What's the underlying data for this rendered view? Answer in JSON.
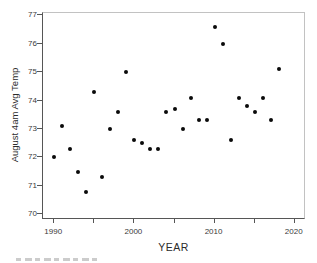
{
  "figure": {
    "xlabel": "YEAR",
    "ylabel": "August 4am Avg Temp",
    "colors": {
      "marker": "#0a0a0a",
      "axis_dark": "#565656",
      "axis_light": "#c2c2c2",
      "tick_text": "#3a3a3a",
      "title_text": "#2b2b2b",
      "background": "#ffffff"
    }
  },
  "chart_data": {
    "type": "scatter",
    "title": "",
    "xlabel": "YEAR",
    "ylabel": "August 4am Avg Temp",
    "x": [
      1990,
      1991,
      1992,
      1993,
      1994,
      1995,
      1996,
      1997,
      1998,
      1999,
      2000,
      2001,
      2002,
      2003,
      2004,
      2005,
      2006,
      2007,
      2008,
      2009,
      2010,
      2011,
      2012,
      2013,
      2014,
      2015,
      2016,
      2017,
      2018
    ],
    "y": [
      72.0,
      73.1,
      72.3,
      71.5,
      70.8,
      74.3,
      71.3,
      73.0,
      73.6,
      75.0,
      72.6,
      72.5,
      72.3,
      72.3,
      73.6,
      73.7,
      73.0,
      74.1,
      73.3,
      73.3,
      76.6,
      76.0,
      72.6,
      74.1,
      73.8,
      73.6,
      74.1,
      73.3,
      75.1
    ],
    "xlim": [
      1988.6,
      2021.4
    ],
    "ylim": [
      69.8,
      77.08
    ],
    "y_ticks": [
      70,
      71,
      72,
      73,
      74,
      75,
      76,
      77
    ],
    "x_major_ticks": [
      1990,
      2000,
      2010,
      2020
    ],
    "x_minor_ticks": [
      1995,
      2005,
      2015
    ],
    "grid": false,
    "legend": null,
    "marker": "filled-circle"
  }
}
